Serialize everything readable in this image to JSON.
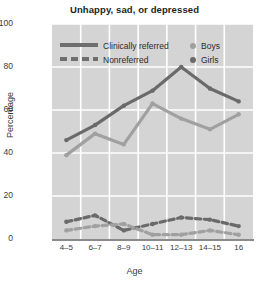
{
  "chart_data": {
    "type": "line",
    "title": "Unhappy, sad, or depressed",
    "xlabel": "Age",
    "ylabel": "Percentage",
    "categories": [
      "4–5",
      "6–7",
      "8–9",
      "10–11",
      "12–13",
      "14–15",
      "16"
    ],
    "ylim": [
      0,
      100
    ],
    "yticks": [
      0,
      20,
      40,
      60,
      80,
      100
    ],
    "grid": true,
    "legend_position": "upper-left-inside",
    "legend": [
      {
        "label": "Clinically referred",
        "style": "solid"
      },
      {
        "label": "Nonreferred",
        "style": "dashed"
      },
      {
        "label": "Boys",
        "style": "marker",
        "color": "#a0a0a0"
      },
      {
        "label": "Girls",
        "style": "marker",
        "color": "#6a6a6a"
      }
    ],
    "series": [
      {
        "name": "Clinically referred — Girls",
        "group": "Clinically referred",
        "sex": "Girls",
        "style": "solid",
        "color": "#6a6a6a",
        "values": [
          46,
          53,
          62,
          69,
          80,
          70,
          64
        ]
      },
      {
        "name": "Clinically referred — Boys",
        "group": "Clinically referred",
        "sex": "Boys",
        "style": "solid",
        "color": "#a0a0a0",
        "values": [
          39,
          49,
          44,
          63,
          56,
          51,
          58
        ]
      },
      {
        "name": "Nonreferred — Girls",
        "group": "Nonreferred",
        "sex": "Girls",
        "style": "dashed",
        "color": "#6a6a6a",
        "values": [
          8,
          11,
          4,
          7,
          10,
          9,
          6
        ]
      },
      {
        "name": "Nonreferred — Boys",
        "group": "Nonreferred",
        "sex": "Boys",
        "style": "dashed",
        "color": "#a0a0a0",
        "values": [
          4,
          6,
          7,
          2,
          2,
          4,
          2
        ]
      }
    ],
    "colors": {
      "plot_background": "#d4d4d4",
      "gridline": "#ffffff",
      "axis": "#8a8a8a",
      "boys": "#a0a0a0",
      "girls": "#6a6a6a",
      "text": "#3a3a3a",
      "title": "#231f20"
    }
  }
}
